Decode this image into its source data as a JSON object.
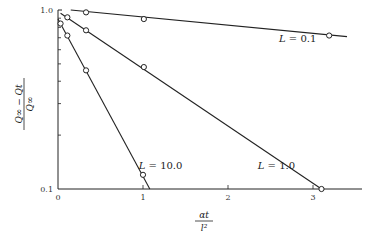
{
  "chart_data": {
    "type": "line",
    "title": "",
    "xlabel": "αt / l²",
    "ylabel": "(Q∞ − Qt) / Q∞",
    "xscale": "linear",
    "yscale": "log",
    "xlim": [
      0,
      3.5
    ],
    "ylim": [
      0.1,
      1.0
    ],
    "x_ticks": [
      0,
      1,
      2,
      3
    ],
    "x_tick_labels": [
      "0",
      "1",
      "2",
      "3"
    ],
    "y_ticks": [
      0.1,
      0.2,
      0.3,
      0.4,
      0.5,
      0.6,
      0.7,
      0.8,
      0.9,
      1.0
    ],
    "y_tick_labels": [
      "0.1",
      "",
      "",
      "",
      "",
      "",
      "",
      "",
      "",
      "1.0"
    ],
    "grid": false,
    "legend": "inline labels",
    "series": [
      {
        "name": "L = 0.1",
        "points": [
          [
            0.33,
            0.97
          ],
          [
            1.01,
            0.89
          ],
          [
            3.19,
            0.72
          ]
        ],
        "line": [
          [
            0.15,
            1.0
          ],
          [
            3.4,
            0.71
          ]
        ],
        "label_pos": [
          2.6,
          0.66
        ]
      },
      {
        "name": "L = 1.0",
        "points": [
          [
            0.11,
            0.91
          ],
          [
            0.33,
            0.77
          ],
          [
            1.01,
            0.48
          ],
          [
            3.1,
            0.1
          ]
        ],
        "line": [
          [
            0.03,
            0.96
          ],
          [
            3.1,
            0.1
          ]
        ],
        "label_pos": [
          2.35,
          0.13
        ]
      },
      {
        "name": "L = 10.0",
        "points": [
          [
            0.03,
            0.84
          ],
          [
            0.11,
            0.72
          ],
          [
            0.33,
            0.46
          ],
          [
            1.0,
            0.12
          ]
        ],
        "line": [
          [
            0.0,
            0.89
          ],
          [
            1.08,
            0.1
          ]
        ],
        "label_pos": [
          0.95,
          0.13
        ]
      }
    ]
  },
  "axes": {
    "y_label_num": "Q∞ − Qt",
    "y_label_den": "Q∞",
    "x_label_num": "αt",
    "x_label_den": "l²"
  }
}
